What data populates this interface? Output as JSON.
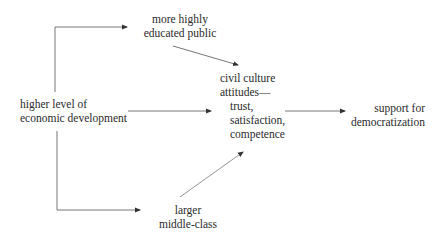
{
  "diagram": {
    "type": "causal-flow",
    "nodes": {
      "economic_development": {
        "lines": [
          "higher level of",
          "economic development"
        ]
      },
      "educated_public": {
        "lines": [
          "more highly",
          "educated public"
        ]
      },
      "middle_class": {
        "lines": [
          "larger",
          "middle-class"
        ]
      },
      "civil_culture": {
        "lines": [
          "civil culture",
          "attitudes—",
          "trust,",
          "satisfaction,",
          "competence"
        ]
      },
      "democratization": {
        "lines": [
          "support for",
          "democratization"
        ]
      }
    },
    "edges": [
      {
        "from": "economic_development",
        "to": "educated_public"
      },
      {
        "from": "economic_development",
        "to": "civil_culture"
      },
      {
        "from": "economic_development",
        "to": "middle_class"
      },
      {
        "from": "educated_public",
        "to": "civil_culture"
      },
      {
        "from": "middle_class",
        "to": "civil_culture"
      },
      {
        "from": "civil_culture",
        "to": "democratization"
      }
    ],
    "colors": {
      "line": "#555555",
      "text": "#2a2a2a",
      "background": "#ffffff"
    }
  }
}
